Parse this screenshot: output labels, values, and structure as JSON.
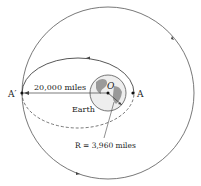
{
  "diagram": {
    "labels": {
      "point_a_prime": "A′",
      "point_a": "A",
      "center": "O",
      "distance": "20,000 miles",
      "earth": "Earth",
      "radius": "R = 3,960 miles"
    },
    "colors": {
      "stroke": "#444444",
      "earth_land": "#9a9a9a",
      "earth_sea": "#e2e2e2"
    }
  }
}
